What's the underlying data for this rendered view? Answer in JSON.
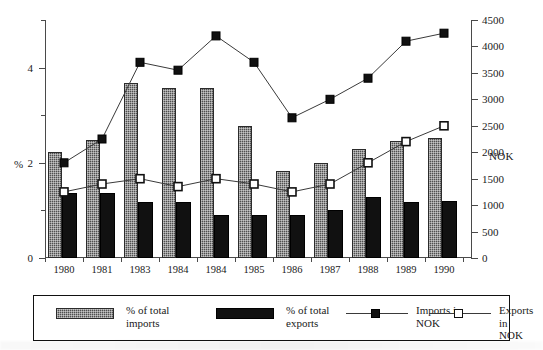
{
  "chart_data": {
    "type": "bar",
    "title": "",
    "xlabel": "",
    "ylabel": "%",
    "y2label": "NOK",
    "ylim": [
      0,
      5
    ],
    "y2lim": [
      0,
      4500
    ],
    "grid": false,
    "legend_position": "bottom",
    "categories": [
      "1980",
      "1981",
      "1983",
      "1984",
      "1984",
      "1985",
      "1986",
      "1987",
      "1988",
      "1989",
      "1990"
    ],
    "left_axis_ticks": [
      "0",
      "2",
      "4"
    ],
    "left_axis_minor_ticks": [
      1,
      3,
      5
    ],
    "right_axis_ticks": [
      "0",
      "500",
      "1000",
      "1500",
      "2000",
      "2500",
      "3000",
      "3500",
      "4000",
      "4500"
    ],
    "series": [
      {
        "name": "% of total imports",
        "kind": "bar",
        "axis": "left",
        "color": "#4f4f4f",
        "values": [
          2.22,
          2.48,
          3.68,
          3.58,
          3.58,
          2.78,
          1.82,
          2.0,
          2.3,
          2.45,
          2.52
        ]
      },
      {
        "name": "% of total exports",
        "kind": "bar",
        "axis": "left",
        "color": "#111111",
        "values": [
          1.37,
          1.37,
          1.18,
          1.18,
          0.9,
          0.9,
          0.9,
          1.0,
          1.28,
          1.18,
          1.2
        ]
      },
      {
        "name": "Imports in NOK",
        "kind": "line",
        "axis": "right",
        "marker": "filled-square",
        "color": "#111111",
        "values": [
          1800,
          2250,
          3700,
          3550,
          4200,
          3700,
          2650,
          3000,
          3400,
          4100,
          4250
        ]
      },
      {
        "name": "Exports in NOK",
        "kind": "line",
        "axis": "right",
        "marker": "open-square",
        "color": "#111111",
        "values": [
          1250,
          1400,
          1500,
          1350,
          1500,
          1400,
          1250,
          1400,
          1800,
          2200,
          2500
        ]
      }
    ]
  },
  "axes": {
    "left_title": "%",
    "right_title": "NOK"
  },
  "legend": {
    "items": [
      {
        "label_line1": "% of total",
        "label_line2": "imports",
        "type": "swatch-hatched",
        "name": "legend-imports-percent"
      },
      {
        "label_line1": "% of total",
        "label_line2": "exports",
        "type": "swatch-solid",
        "name": "legend-exports-percent"
      },
      {
        "label_line1": "Imports in",
        "label_line2": "NOK",
        "type": "line-filled-square",
        "name": "legend-imports-nok"
      },
      {
        "label_line1": "Exports in",
        "label_line2": "NOK",
        "type": "line-open-square",
        "name": "legend-exports-nok"
      }
    ]
  },
  "colors": {
    "imports_bar": "#4f4f4f",
    "exports_bar": "#111111",
    "line": "#3a3a3a",
    "axis": "#4a4a4a"
  }
}
